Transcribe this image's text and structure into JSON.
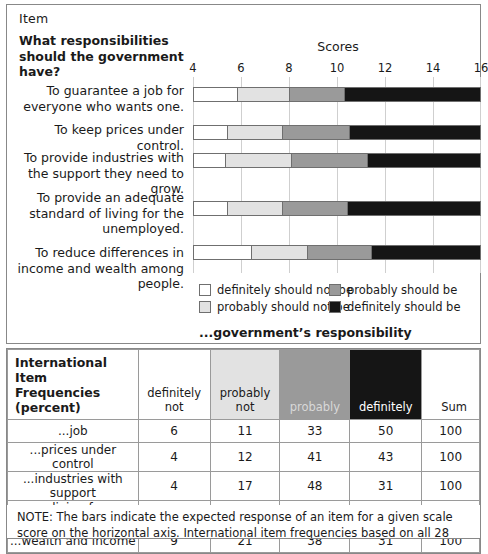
{
  "panel": {
    "item_header": "Item",
    "question": "What responsibilities should the government have?",
    "scores_title": "Scores",
    "legend_caption": "...government’s responsibility"
  },
  "colors": {
    "definitely_not": "#ffffff",
    "probably_not": "#e2e2e2",
    "probably": "#9a9a9a",
    "definitely": "#151515",
    "border": "#6f6f6f",
    "gridline": "#cfcfcf",
    "panel_border": "#888888"
  },
  "legend": [
    {
      "label": "definitely should not be",
      "color": "#ffffff",
      "key": "definitely_not"
    },
    {
      "label": "probably should be",
      "color": "#9a9a9a",
      "key": "probably"
    },
    {
      "label": "probably should not be",
      "color": "#e2e2e2",
      "key": "probably_not"
    },
    {
      "label": "definitely should be",
      "color": "#151515",
      "key": "definitely"
    }
  ],
  "chart_data": {
    "type": "bar",
    "orientation": "horizontal",
    "stacked": true,
    "title": "Scores",
    "xlabel": "",
    "ylabel": "",
    "xlim": [
      4,
      16
    ],
    "xticks": [
      4,
      6,
      8,
      10,
      12,
      14,
      16
    ],
    "xtick_labels": [
      "4",
      "6",
      "8",
      "10",
      "12",
      "14",
      "16"
    ],
    "grid": true,
    "grid_axis": "x",
    "legend_position": "bottom",
    "categories": [
      "To guarantee a job for everyone who wants one.",
      "To keep prices under control.",
      "To provide industries with the support they need to grow.",
      "To provide an adequate standard of living for the unemployed.",
      "To reduce differences in income and wealth among people."
    ],
    "series": [
      {
        "name": "definitely should not be",
        "color": "#ffffff",
        "boundaries": [
          5.85,
          5.4,
          5.35,
          5.4,
          6.4
        ]
      },
      {
        "name": "probably should not be",
        "color": "#e2e2e2",
        "boundaries": [
          8.0,
          7.7,
          8.1,
          7.7,
          8.75
        ]
      },
      {
        "name": "probably should be",
        "color": "#9a9a9a",
        "boundaries": [
          10.3,
          10.5,
          11.25,
          10.4,
          11.4
        ]
      },
      {
        "name": "definitely should be",
        "color": "#151515",
        "boundaries": [
          16.0,
          16.0,
          16.0,
          16.0,
          16.0
        ]
      }
    ]
  },
  "table": {
    "header_title_line1": "International Item",
    "header_title_line2": "Frequencies (percent)",
    "columns": [
      {
        "line1": "definitely",
        "line2": "not",
        "bg": "bg-white"
      },
      {
        "line1": "probably",
        "line2": "not",
        "bg": "bg-light"
      },
      {
        "line1": "probably",
        "line2": "",
        "bg": "bg-mid"
      },
      {
        "line1": "definitely",
        "line2": "",
        "bg": "bg-dark"
      }
    ],
    "sum_header": "Sum",
    "rows": [
      {
        "name": "...job",
        "values": [
          "6",
          "11",
          "33",
          "50"
        ],
        "sum": "100"
      },
      {
        "name": "...prices under control",
        "values": [
          "4",
          "12",
          "41",
          "43"
        ],
        "sum": "100"
      },
      {
        "name": "...industries with support",
        "values": [
          "4",
          "17",
          "48",
          "31"
        ],
        "sum": "100"
      },
      {
        "name": "...living for unemployed",
        "values": [
          "4",
          "12",
          "41",
          "43"
        ],
        "sum": "100"
      },
      {
        "name": "...wealth and income",
        "values": [
          "9",
          "21",
          "38",
          "31"
        ],
        "sum": "100"
      }
    ]
  },
  "note": {
    "text": "NOTE: The bars indicate the expected response of an item for a given scale score on the horizontal axis. International item frequencies based on all 28 equally weighted country data"
  }
}
